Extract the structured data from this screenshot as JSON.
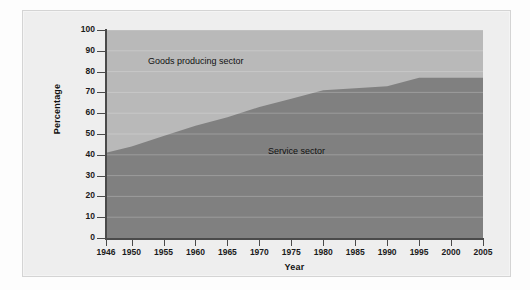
{
  "figure": {
    "background": "#eeeeee",
    "border_color": "#d4d4d4"
  },
  "chart_data": {
    "type": "area",
    "stacked": true,
    "title": "",
    "subtitle": "",
    "xlabel": "Year",
    "ylabel": "Percentage",
    "xlim": [
      1946,
      2005
    ],
    "ylim": [
      0,
      100
    ],
    "grid": true,
    "legend_position": "inside-annotations",
    "x": [
      1946,
      1950,
      1955,
      1960,
      1965,
      1970,
      1975,
      1980,
      1985,
      1990,
      1995,
      2000,
      2005
    ],
    "yticks": [
      0,
      10,
      20,
      30,
      40,
      50,
      60,
      70,
      80,
      90,
      100
    ],
    "ytick_labels": [
      "0",
      "10",
      "20",
      "30",
      "40",
      "50",
      "60",
      "70",
      "80",
      "90",
      "100"
    ],
    "xticks": [
      1946,
      1950,
      1955,
      1960,
      1965,
      1970,
      1975,
      1980,
      1985,
      1990,
      1995,
      2000,
      2005
    ],
    "xtick_labels": [
      "1946",
      "1950",
      "1955",
      "1960",
      "1965",
      "1970",
      "1975",
      "1980",
      "1985",
      "1990",
      "1995",
      "2000",
      "2005"
    ],
    "series": [
      {
        "name": "Service sector",
        "color": "#808080",
        "values": [
          41,
          44,
          49,
          54,
          58,
          63,
          67,
          71,
          72,
          73,
          77,
          77,
          77
        ]
      },
      {
        "name": "Goods producing sector",
        "color": "#b9b9b9",
        "values": [
          59,
          56,
          51,
          46,
          42,
          37,
          33,
          29,
          28,
          27,
          23,
          23,
          23
        ]
      }
    ],
    "annotations": [
      {
        "text": "Goods producing sector",
        "x": 1953,
        "y": 87
      },
      {
        "text": "Service sector",
        "x": 1972,
        "y": 44
      }
    ]
  }
}
